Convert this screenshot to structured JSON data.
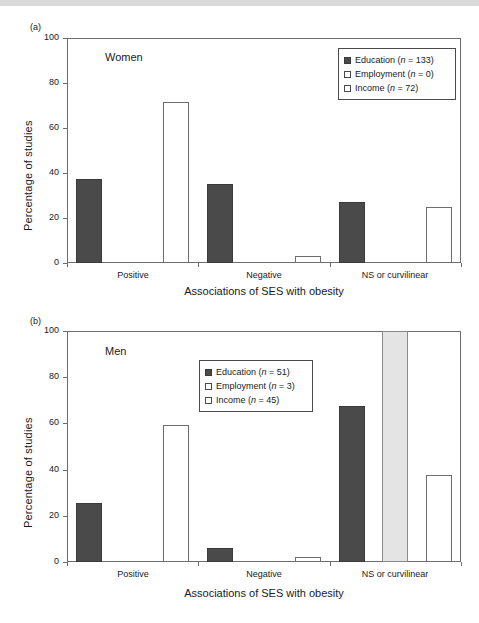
{
  "figure": {
    "panels": [
      {
        "tag": "(a)",
        "group_title": "Women",
        "ylabel": "Percentage of studies",
        "xlabel": "Associations of SES with obesity",
        "yticks": [
          "0",
          "20",
          "40",
          "60",
          "80",
          "100"
        ],
        "categories": [
          "Positive",
          "Negative",
          "NS or curvilinear"
        ],
        "legend": [
          {
            "swatch": "education",
            "label": "Education (",
            "n_prefix": "n",
            "n_value": " = 133)"
          },
          {
            "swatch": "employment",
            "label": "Employment (",
            "n_prefix": "n",
            "n_value": " = 0)"
          },
          {
            "swatch": "income",
            "label": "Income (",
            "n_prefix": "n",
            "n_value": " = 72)"
          }
        ]
      },
      {
        "tag": "(b)",
        "group_title": "Men",
        "ylabel": "Percentage of studies",
        "xlabel": "Associations of SES with obesity",
        "yticks": [
          "0",
          "20",
          "40",
          "60",
          "80",
          "100"
        ],
        "categories": [
          "Positive",
          "Negative",
          "NS or curvilinear"
        ],
        "legend": [
          {
            "swatch": "education",
            "label": "Education (",
            "n_prefix": "n",
            "n_value": " = 51)"
          },
          {
            "swatch": "employment",
            "label": "Employment (",
            "n_prefix": "n",
            "n_value": " = 3)"
          },
          {
            "swatch": "income",
            "label": "Income (",
            "n_prefix": "n",
            "n_value": " = 45)"
          }
        ]
      }
    ]
  },
  "chart_data": [
    {
      "type": "bar",
      "panel": "(a)",
      "title": "Women",
      "xlabel": "Associations of SES with obesity",
      "ylabel": "Percentage of studies",
      "ylim": [
        0,
        100
      ],
      "yticks": [
        0,
        20,
        40,
        60,
        80,
        100
      ],
      "grid": false,
      "legend_position": "top-right",
      "categories": [
        "Positive",
        "Negative",
        "NS or curvilinear"
      ],
      "series": [
        {
          "name": "Education (n = 133)",
          "color": "#4a4a4a",
          "values": [
            37.5,
            35.0,
            27.0
          ]
        },
        {
          "name": "Employment (n = 0)",
          "color": "#ffffff",
          "values": [
            0,
            0,
            0
          ]
        },
        {
          "name": "Income (n = 72)",
          "color": "#ffffff",
          "values": [
            71.5,
            3.0,
            25.0
          ]
        }
      ]
    },
    {
      "type": "bar",
      "panel": "(b)",
      "title": "Men",
      "xlabel": "Associations of SES with obesity",
      "ylabel": "Percentage of studies",
      "ylim": [
        0,
        100
      ],
      "yticks": [
        0,
        20,
        40,
        60,
        80,
        100
      ],
      "grid": false,
      "legend_position": "top-center",
      "categories": [
        "Positive",
        "Negative",
        "NS or curvilinear"
      ],
      "series": [
        {
          "name": "Education (n = 51)",
          "color": "#4a4a4a",
          "values": [
            25.5,
            6.0,
            67.5
          ]
        },
        {
          "name": "Employment (n = 3)",
          "color": "#e4e4e4",
          "values": [
            0,
            0,
            100
          ]
        },
        {
          "name": "Income (n = 45)",
          "color": "#ffffff",
          "values": [
            59.5,
            2.0,
            37.5
          ]
        }
      ]
    }
  ],
  "colors": {
    "education": "#4a4a4a",
    "employment": "#e4e4e4",
    "income": "#ffffff",
    "axis": "#6e6e6e",
    "text": "#1a1a1a"
  }
}
